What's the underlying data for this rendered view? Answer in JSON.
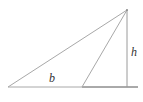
{
  "diagram": {
    "title": "",
    "type": "triangle-base-height",
    "labels": {
      "base": "b",
      "height": "h"
    },
    "points": {
      "left_vertex": [
        8,
        87
      ],
      "right_vertex": [
        82,
        87
      ],
      "apex": [
        127,
        10
      ],
      "height_foot": [
        127,
        87
      ],
      "base_line_end": [
        138,
        87
      ]
    },
    "colors": {
      "triangle_stroke": "#a8a8a8",
      "height_stroke": "#9a9a9a",
      "baseline_stroke": "#555555",
      "label": "#333333"
    }
  }
}
